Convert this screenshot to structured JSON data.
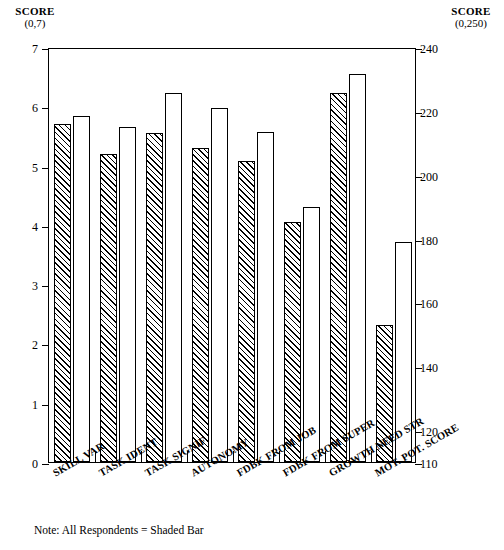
{
  "chart_data": {
    "type": "bar",
    "title": "",
    "categories": [
      "SKILL VAR",
      "TASK IDENT",
      "TASK SIGNIF",
      "AUTONOMY",
      "FDBK FROM JOB",
      "FDBK FROM SUPER",
      "GROWTH NEED STR",
      "MOT. POT. SCORE"
    ],
    "series": [
      {
        "name": "All Respondents (Shaded Bar)",
        "values": [
          5.7,
          5.2,
          5.55,
          5.3,
          5.08,
          4.05,
          6.23,
          153
        ]
      },
      {
        "name": "Comparison (Open Bar)",
        "values": [
          5.83,
          5.65,
          6.22,
          5.97,
          5.57,
          4.3,
          6.55,
          179
        ]
      }
    ],
    "left_axis": {
      "label": "SCORE",
      "range_text": "(0,7)",
      "ylim": [
        0,
        7
      ],
      "ticks": [
        0,
        1,
        2,
        3,
        4,
        5,
        6,
        7
      ],
      "applies_to_categories": [
        "SKILL VAR",
        "TASK IDENT",
        "TASK SIGNIF",
        "AUTONOMY",
        "FDBK FROM JOB",
        "FDBK FROM SUPER",
        "GROWTH NEED STR"
      ]
    },
    "right_axis": {
      "label": "SCORE",
      "range_text": "(0,250)",
      "ylim": [
        110,
        240
      ],
      "ticks": [
        110,
        120,
        140,
        160,
        180,
        200,
        220,
        240
      ],
      "applies_to_categories": [
        "MOT. POT. SCORE"
      ]
    },
    "grid": false,
    "legend": "none",
    "note": "Note:  All Respondents = Shaded Bar",
    "xlabel": "",
    "ylabel": "SCORE"
  }
}
